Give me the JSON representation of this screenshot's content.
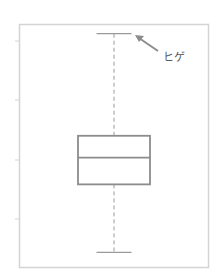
{
  "figure": {
    "type": "boxplot",
    "annotation_label": "ヒゲ",
    "colors": {
      "frame": "#d4d4d4",
      "box": "#8c8c8c",
      "whisker": "#9a9a9a",
      "arrow": "#8c8c8c",
      "text": "#555555"
    }
  },
  "chart_data": {
    "type": "boxplot",
    "title": "",
    "xlabel": "",
    "ylabel": "",
    "ytick_labels": [
      "",
      "",
      "",
      ""
    ],
    "ylim": [
      0,
      1
    ],
    "series": [
      {
        "name": "",
        "whisker_low": 0.06,
        "q1": 0.34,
        "median": 0.45,
        "q3": 0.54,
        "whisker_high": 0.96
      }
    ],
    "annotations": [
      {
        "text": "ヒゲ",
        "points_to": "whisker_high"
      }
    ],
    "grid": false,
    "legend": "none"
  }
}
